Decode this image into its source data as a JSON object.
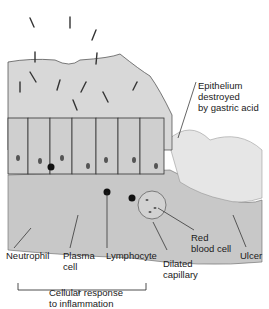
{
  "diagram": {
    "labels": {
      "epithelium": "Epithelium\ndestroyed\nby gastric acid",
      "neutrophil": "Neutrophil",
      "plasma_cell": "Plasma\ncell",
      "lymphocyte": "Lymphocyte",
      "red_blood_cell": "Red\nblood cell",
      "dilated_capillary": "Dilated\ncapillary",
      "ulcer": "Ulcer",
      "bracket_caption": "Cellular response\nto inflammation"
    },
    "colors": {
      "mucus": "#d6d6d6",
      "tissue": "#c4c4c4",
      "ulcer": "#e4e4e4",
      "outline": "#333333",
      "nucleus": "#555555",
      "lymphocyte": "#111111"
    }
  }
}
